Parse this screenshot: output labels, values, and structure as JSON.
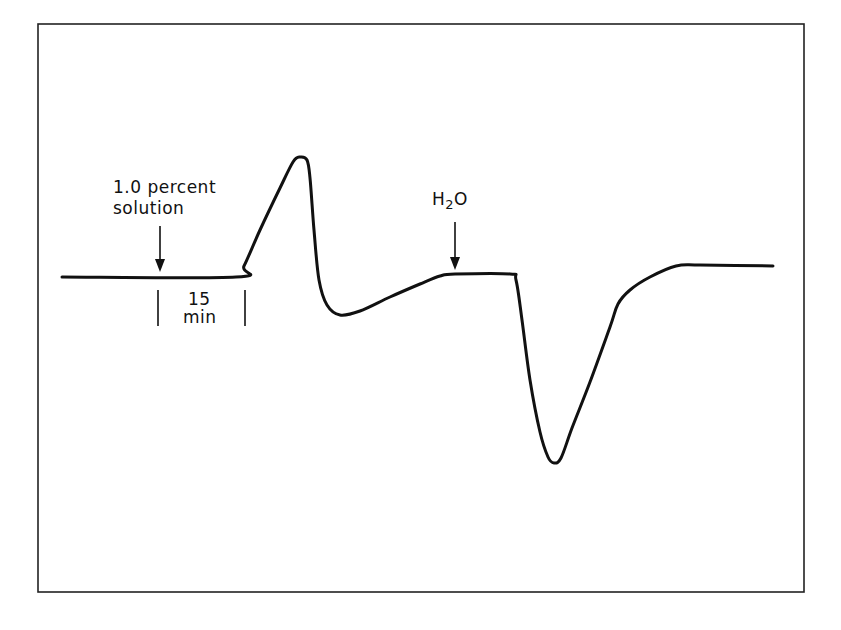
{
  "chart_data": {
    "type": "line",
    "title": "",
    "xlabel": "",
    "ylabel": "",
    "grid": false,
    "legend": null,
    "annotations": [
      {
        "text": "1.0 percent solution",
        "type": "arrow",
        "x_px": 160,
        "target_y_px": 273
      },
      {
        "text": "H2O",
        "type": "arrow",
        "x_px": 455,
        "target_y_px": 270
      },
      {
        "text": "15 min",
        "type": "scale-bar",
        "x_start_px": 157,
        "x_end_px": 246
      }
    ],
    "scale": {
      "label_value": "15",
      "label_unit": "min"
    },
    "trace_points_px": [
      [
        62,
        277
      ],
      [
        236,
        277
      ],
      [
        244,
        266
      ],
      [
        260,
        230
      ],
      [
        280,
        188
      ],
      [
        293,
        162
      ],
      [
        300,
        157
      ],
      [
        307,
        160
      ],
      [
        310,
        178
      ],
      [
        314,
        230
      ],
      [
        319,
        280
      ],
      [
        327,
        305
      ],
      [
        340,
        315
      ],
      [
        360,
        311
      ],
      [
        390,
        297
      ],
      [
        420,
        284
      ],
      [
        440,
        276
      ],
      [
        455,
        274
      ],
      [
        510,
        274
      ],
      [
        516,
        280
      ],
      [
        522,
        320
      ],
      [
        530,
        380
      ],
      [
        540,
        432
      ],
      [
        548,
        457
      ],
      [
        554,
        463
      ],
      [
        561,
        458
      ],
      [
        572,
        428
      ],
      [
        590,
        382
      ],
      [
        610,
        327
      ],
      [
        618,
        304
      ],
      [
        630,
        290
      ],
      [
        650,
        277
      ],
      [
        676,
        266
      ],
      [
        700,
        265
      ],
      [
        773,
        266
      ]
    ]
  },
  "labels": {
    "solution_line1": "1.0 percent",
    "solution_line2": "solution",
    "water_main": "H",
    "water_sub": "2",
    "water_end": "O",
    "scale_value": "15",
    "scale_unit": "min"
  }
}
